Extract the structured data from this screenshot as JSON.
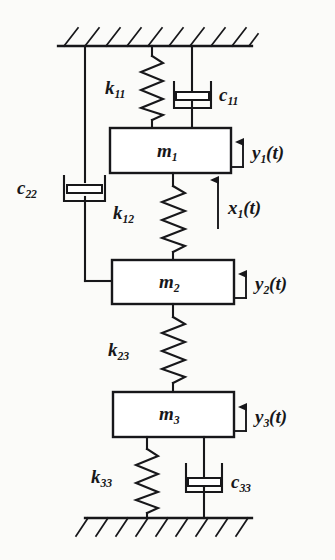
{
  "figure": {
    "type": "mechanical-schematic",
    "background_color": "#fbfbf9",
    "ink_color": "#17171a"
  },
  "supports": {
    "ceiling": {
      "name": "fixed-ceiling",
      "hatch_count": 10
    },
    "ground": {
      "name": "fixed-ground",
      "hatch_count": 9
    }
  },
  "masses": [
    {
      "id": "m1",
      "base": "m",
      "sub": "1"
    },
    {
      "id": "m2",
      "base": "m",
      "sub": "2"
    },
    {
      "id": "m3",
      "base": "m",
      "sub": "3"
    }
  ],
  "springs": [
    {
      "id": "k11",
      "base": "k",
      "sub": "11"
    },
    {
      "id": "k12",
      "base": "k",
      "sub": "12"
    },
    {
      "id": "k23",
      "base": "k",
      "sub": "23"
    },
    {
      "id": "k33",
      "base": "k",
      "sub": "33"
    }
  ],
  "dampers": [
    {
      "id": "c11",
      "base": "c",
      "sub": "11"
    },
    {
      "id": "c22",
      "base": "c",
      "sub": "22"
    },
    {
      "id": "c33",
      "base": "c",
      "sub": "33"
    }
  ],
  "displacements": [
    {
      "id": "y1",
      "base": "y",
      "sub": "1",
      "arg": "(t)"
    },
    {
      "id": "y2",
      "base": "y",
      "sub": "2",
      "arg": "(t)"
    },
    {
      "id": "y3",
      "base": "y",
      "sub": "3",
      "arg": "(t)"
    }
  ],
  "inputs": [
    {
      "id": "x1",
      "base": "x",
      "sub": "1",
      "arg": "(t)"
    }
  ],
  "labels": {
    "m1": "m",
    "m1_sub": "1",
    "m2": "m",
    "m2_sub": "2",
    "m3": "m",
    "m3_sub": "3",
    "k11": "k",
    "k11_sub": "11",
    "k12": "k",
    "k12_sub": "12",
    "k23": "k",
    "k23_sub": "23",
    "k33": "k",
    "k33_sub": "33",
    "c11": "c",
    "c11_sub": "11",
    "c22": "c",
    "c22_sub": "22",
    "c33": "c",
    "c33_sub": "33",
    "y1": "y",
    "y1_sub": "1",
    "y1_arg": "(t)",
    "y2": "y",
    "y2_sub": "2",
    "y2_arg": "(t)",
    "y3": "y",
    "y3_sub": "3",
    "y3_arg": "(t)",
    "x1": "x",
    "x1_sub": "1",
    "x1_arg": "(t)"
  }
}
